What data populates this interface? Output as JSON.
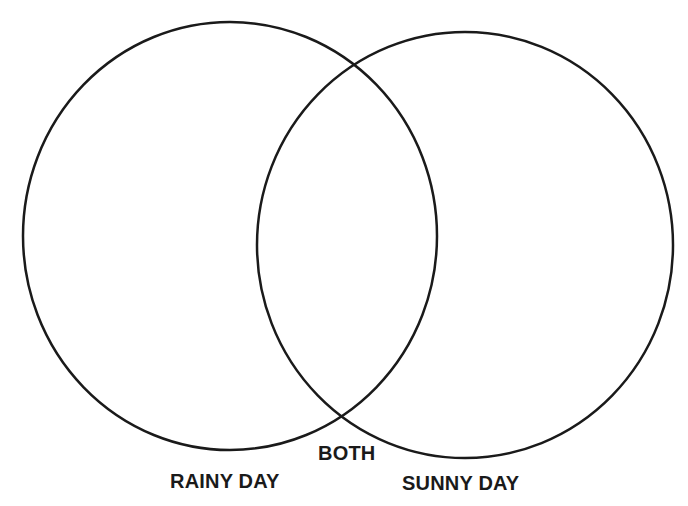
{
  "diagram": {
    "type": "venn",
    "sets": [
      {
        "id": "left",
        "label": "RAINY DAY",
        "ellipse": {
          "cx": 230,
          "cy": 236,
          "rx": 207,
          "ry": 214
        }
      },
      {
        "id": "right",
        "label": "SUNNY DAY",
        "ellipse": {
          "cx": 465,
          "cy": 245,
          "rx": 208,
          "ry": 213
        }
      }
    ],
    "intersection_label": "BOTH",
    "stroke_color": "#1a1a1a",
    "stroke_width": 2.5,
    "background": "#ffffff"
  }
}
